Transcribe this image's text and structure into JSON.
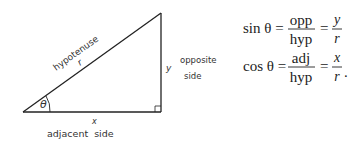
{
  "triangle": {
    "labels": {
      "hypotenuse": "hypotenuse",
      "r": "r",
      "y": "y",
      "opposite_line1": "opposite",
      "opposite_line2": "side",
      "x": "x",
      "adjacent": "adjacent  side",
      "theta": "θ"
    }
  },
  "formulas": {
    "sin": {
      "lhs": "sin θ =",
      "num1": "opp",
      "den1": "hyp",
      "eq": "=",
      "num2": "y",
      "den2": "r"
    },
    "cos": {
      "lhs": "cos θ =",
      "num1": "adj",
      "den1": "hyp",
      "eq": "=",
      "num2": "x",
      "den2": "r",
      "end": "."
    }
  }
}
